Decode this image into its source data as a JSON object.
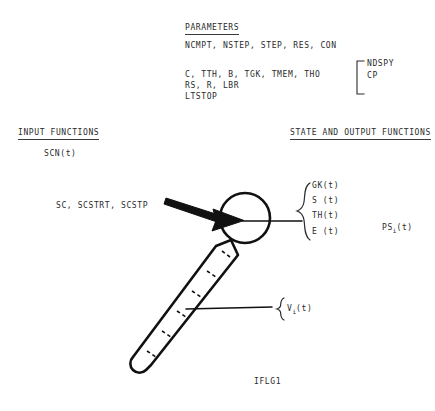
{
  "figure": {
    "caption_bottom": "IFLG1",
    "background_color": "#ffffff",
    "ink_color": "#1a1a1a"
  },
  "parameters_section": {
    "heading": "PARAMETERS",
    "line_1": "NCMPT, NSTEP, STEP, RES, CON",
    "line_2": "C, TTH, B, TGK, TMEM, THO",
    "line_3": "RS, R, LBR",
    "line_4": "LTSTOP",
    "bracket_group": {
      "item_1": "NDSPY",
      "item_2": "CP"
    }
  },
  "input_section": {
    "heading": "INPUT FUNCTIONS",
    "function_1": "SCN(t)",
    "function_2": "SC, SCSTRT, SCSTP"
  },
  "output_section": {
    "heading": "STATE AND OUTPUT FUNCTIONS",
    "soma_brace": {
      "item_1": "GK(t)",
      "item_2": "S (t)",
      "item_3": "TH(t)",
      "item_4": "E (t)"
    },
    "spike_output": {
      "base": "PS",
      "subscript": "i",
      "argument": "(t)"
    },
    "dendrite_brace": {
      "base": "V",
      "subscript": "i",
      "argument": "(t)"
    }
  },
  "diagram": {
    "soma_label": "soma-circle",
    "dendrite_label": "dendrite-compartments",
    "input_arrow_label": "synaptic-input-arrow",
    "axon_line_label": "axon-output-line"
  }
}
